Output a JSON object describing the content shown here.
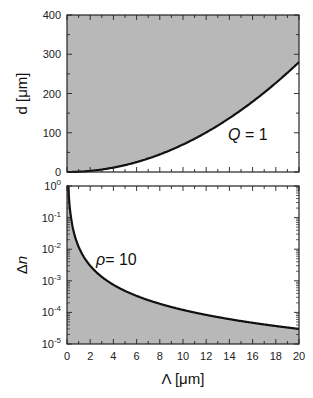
{
  "chart_data": [
    {
      "type": "area",
      "title": "",
      "xlabel": "Λ [μm]",
      "ylabel": "d [μm]",
      "xlim": [
        0,
        20
      ],
      "ylim": [
        0,
        400
      ],
      "yticks": [
        "0",
        "100",
        "200",
        "300",
        "400"
      ],
      "annotation": "Q = 1",
      "fill": "above curve",
      "fill_color": "#b8b8b8",
      "series": [
        {
          "name": "Q=1",
          "x": [
            0,
            2,
            4,
            6,
            8,
            10,
            12,
            14,
            16,
            18,
            20
          ],
          "values": [
            0,
            3,
            12,
            27,
            48,
            73,
            103,
            137,
            178,
            225,
            280
          ]
        }
      ]
    },
    {
      "type": "area",
      "title": "",
      "xlabel": "Λ [μm]",
      "ylabel": "Δn",
      "xscale": "linear",
      "yscale": "log",
      "xlim": [
        0,
        20
      ],
      "ylim": [
        1e-05,
        1
      ],
      "xticks": [
        "0",
        "2",
        "4",
        "6",
        "8",
        "10",
        "12",
        "14",
        "16",
        "18",
        "20"
      ],
      "yticks": [
        "10^0",
        "10^-1",
        "10^-2",
        "10^-3",
        "10^-4",
        "10^-5"
      ],
      "annotation": "ρ = 10",
      "fill": "below curve",
      "fill_color": "#b8b8b8",
      "series": [
        {
          "name": "ρ=10",
          "x": [
            0.1,
            0.5,
            1,
            2,
            4,
            6,
            8,
            10,
            12,
            14,
            16,
            18,
            20
          ],
          "values": [
            1.0,
            0.05,
            0.012,
            0.003,
            0.0008,
            0.00035,
            0.0002,
            0.00012,
            8e-05,
            6e-05,
            4.5e-05,
            3.5e-05,
            3e-05
          ]
        }
      ]
    }
  ],
  "labels": {
    "top_ylabel": "d [μm]",
    "bottom_ylabel": "Δn",
    "xlabel": "Λ [μm]",
    "top_annotation_q": "Q",
    "top_annotation_rest": " = 1",
    "bottom_annotation_rho": "ρ",
    "bottom_annotation_rest": "= 10"
  }
}
